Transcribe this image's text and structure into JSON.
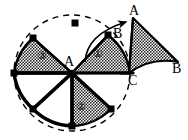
{
  "figure": {
    "type": "geometry-diagram",
    "canvas": {
      "width": 188,
      "height": 140,
      "background": "#ffffff"
    },
    "colors": {
      "stroke": "#000000",
      "fill_stipple": "#000000",
      "background": "#ffffff",
      "dashed": "#000000"
    },
    "center": {
      "name": "A",
      "x": 72,
      "y": 73
    },
    "circle": {
      "cx": 72,
      "cy": 73,
      "r": 58
    },
    "point_labels": [
      {
        "id": "label-A-center",
        "text": "A",
        "x": 64,
        "y": 61,
        "size": "pt"
      },
      {
        "id": "label-A-top",
        "text": "A",
        "x": 129,
        "y": 10,
        "size": "pt"
      },
      {
        "id": "label-B-inner",
        "text": "B",
        "x": 113,
        "y": 27,
        "size": "pt"
      },
      {
        "id": "label-B-outer",
        "text": "B",
        "x": 172,
        "y": 62,
        "size": "pt"
      },
      {
        "id": "label-C",
        "text": "C",
        "x": 128,
        "y": 76,
        "size": "pt"
      }
    ],
    "sector_labels": [
      {
        "id": "sector-1",
        "text": "①",
        "x": 96,
        "y": 54,
        "size": "num"
      },
      {
        "id": "sector-2",
        "text": "②",
        "x": 79,
        "y": 107,
        "size": "num"
      },
      {
        "id": "sector-3",
        "text": "③",
        "x": 40,
        "y": 56,
        "size": "num"
      }
    ],
    "sectors": [
      {
        "id": "sector-one",
        "label": "①",
        "filled": true,
        "note": "upper-right stippled sector"
      },
      {
        "id": "sector-two",
        "label": "②",
        "filled": true,
        "note": "bottom stippled sector"
      },
      {
        "id": "sector-three",
        "label": "③",
        "filled": true,
        "note": "upper-left stippled sector"
      },
      {
        "id": "sector-blank",
        "label": "",
        "filled": false,
        "note": "lower-left unshaded sector"
      },
      {
        "id": "sector-detached",
        "label": "",
        "filled": true,
        "note": "detached rotated sector A-B-C at right"
      }
    ],
    "markers": [
      {
        "id": "vertex-dot-top",
        "x": 75,
        "y": 23
      },
      {
        "id": "vertex-dot-upper-left",
        "x": 33,
        "y": 38
      },
      {
        "id": "vertex-dot-left",
        "x": 14,
        "y": 73
      },
      {
        "id": "vertex-dot-lower-left",
        "x": 33,
        "y": 109
      },
      {
        "id": "vertex-dot-bottom",
        "x": 72,
        "y": 126
      },
      {
        "id": "vertex-dot-lower-right",
        "x": 111,
        "y": 109
      },
      {
        "id": "vertex-dot-B",
        "x": 108,
        "y": 35
      }
    ],
    "arrow": {
      "id": "rotation-arrow",
      "note": "curved arrow from inner sector edge sweeping up-right to point A"
    }
  }
}
